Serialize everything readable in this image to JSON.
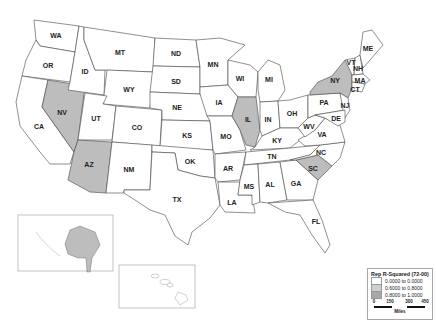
{
  "map": {
    "title": "Rep R-Squared (72-00)",
    "colors": {
      "low": "#ffffff",
      "mid": "#bdbdbd",
      "high": "#a8a8a8",
      "border": "#444444"
    },
    "states": [
      {
        "abbr": "WA",
        "x": 56,
        "y": 35,
        "class": "low"
      },
      {
        "abbr": "OR",
        "x": 48,
        "y": 65,
        "class": "low"
      },
      {
        "abbr": "ID",
        "x": 85,
        "y": 71,
        "class": "low"
      },
      {
        "abbr": "MT",
        "x": 120,
        "y": 52,
        "class": "low"
      },
      {
        "abbr": "WY",
        "x": 129,
        "y": 89,
        "class": "low"
      },
      {
        "abbr": "NV",
        "x": 62,
        "y": 112,
        "class": "mid"
      },
      {
        "abbr": "UT",
        "x": 96,
        "y": 118,
        "class": "low"
      },
      {
        "abbr": "CO",
        "x": 137,
        "y": 127,
        "class": "low"
      },
      {
        "abbr": "CA",
        "x": 39,
        "y": 126,
        "class": "low"
      },
      {
        "abbr": "AZ",
        "x": 89,
        "y": 164,
        "class": "mid"
      },
      {
        "abbr": "NM",
        "x": 129,
        "y": 169,
        "class": "low"
      },
      {
        "abbr": "ND",
        "x": 176,
        "y": 53,
        "class": "low"
      },
      {
        "abbr": "SD",
        "x": 176,
        "y": 81,
        "class": "low"
      },
      {
        "abbr": "NE",
        "x": 177,
        "y": 107,
        "class": "low"
      },
      {
        "abbr": "KS",
        "x": 187,
        "y": 135,
        "class": "low"
      },
      {
        "abbr": "OK",
        "x": 190,
        "y": 161,
        "class": "low"
      },
      {
        "abbr": "TX",
        "x": 177,
        "y": 199,
        "class": "low"
      },
      {
        "abbr": "MN",
        "x": 213,
        "y": 64,
        "class": "low"
      },
      {
        "abbr": "IA",
        "x": 219,
        "y": 102,
        "class": "low"
      },
      {
        "abbr": "MO",
        "x": 226,
        "y": 136,
        "class": "low"
      },
      {
        "abbr": "AR",
        "x": 228,
        "y": 168,
        "class": "low"
      },
      {
        "abbr": "LA",
        "x": 232,
        "y": 202,
        "class": "low"
      },
      {
        "abbr": "WI",
        "x": 240,
        "y": 78,
        "class": "low"
      },
      {
        "abbr": "IL",
        "x": 248,
        "y": 119,
        "class": "mid"
      },
      {
        "abbr": "MI",
        "x": 269,
        "y": 79,
        "class": "low"
      },
      {
        "abbr": "IN",
        "x": 268,
        "y": 119,
        "class": "low"
      },
      {
        "abbr": "OH",
        "x": 292,
        "y": 113,
        "class": "low"
      },
      {
        "abbr": "KY",
        "x": 277,
        "y": 140,
        "class": "low"
      },
      {
        "abbr": "TN",
        "x": 272,
        "y": 156,
        "class": "low"
      },
      {
        "abbr": "MS",
        "x": 249,
        "y": 186,
        "class": "low"
      },
      {
        "abbr": "AL",
        "x": 270,
        "y": 184,
        "class": "low"
      },
      {
        "abbr": "GA",
        "x": 296,
        "y": 183,
        "class": "low"
      },
      {
        "abbr": "FL",
        "x": 316,
        "y": 221,
        "class": "low"
      },
      {
        "abbr": "SC",
        "x": 313,
        "y": 168,
        "class": "mid"
      },
      {
        "abbr": "NC",
        "x": 321,
        "y": 152,
        "class": "low"
      },
      {
        "abbr": "VA",
        "x": 322,
        "y": 134,
        "class": "low"
      },
      {
        "abbr": "WV",
        "x": 309,
        "y": 126,
        "class": "low"
      },
      {
        "abbr": "PA",
        "x": 324,
        "y": 102,
        "class": "low"
      },
      {
        "abbr": "NY",
        "x": 335,
        "y": 80,
        "class": "mid"
      },
      {
        "abbr": "ME",
        "x": 368,
        "y": 48,
        "class": "low"
      },
      {
        "abbr": "VT",
        "x": 351,
        "y": 62,
        "class": "low"
      },
      {
        "abbr": "NH",
        "x": 358,
        "y": 68,
        "class": "low"
      },
      {
        "abbr": "MA",
        "x": 360,
        "y": 80,
        "class": "low"
      },
      {
        "abbr": "CT",
        "x": 355,
        "y": 89,
        "class": "low"
      },
      {
        "abbr": "NJ",
        "x": 345,
        "y": 105,
        "class": "low"
      },
      {
        "abbr": "DE",
        "x": 336,
        "y": 118,
        "class": "low"
      }
    ]
  },
  "legend": {
    "title": "Rep R-Squared (72-00)",
    "items": [
      {
        "label": "0.0000 to 0.0000",
        "color": "#ffffff"
      },
      {
        "label": "0.6000 to 0.8000",
        "color": "#cfcfcf"
      },
      {
        "label": "0.8000 to 1.0000",
        "color": "#a8a8a8"
      }
    ],
    "scale": {
      "ticks": [
        "0",
        "150",
        "300",
        "450"
      ],
      "unit": "Miles"
    }
  }
}
